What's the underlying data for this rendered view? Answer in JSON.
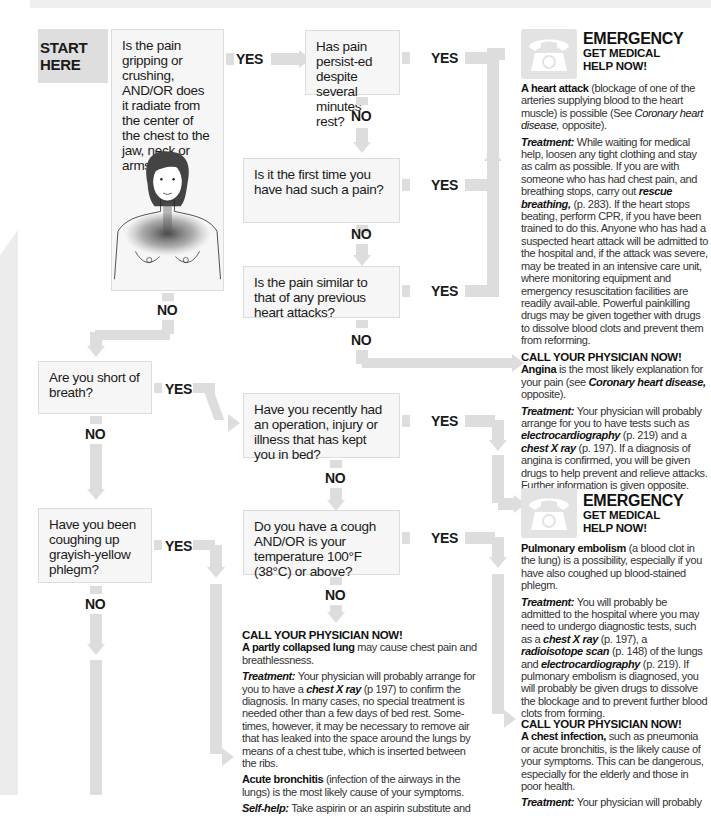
{
  "start": {
    "line1": "START",
    "line2": "HERE"
  },
  "questions": {
    "q1": "Is the pain gripping or crushing, AND/OR does it radiate from the center of the chest to the jaw, neck or arms?",
    "q2": "Has pain persist-ed despite several minutes' rest?",
    "q3": "Is it the first time you have had such a pain?",
    "q4": "Is the pain similar to that of any previous heart attacks?",
    "q5": "Are you short of breath?",
    "q6": "Have you recently had an operation, injury or illness that has kept you in bed?",
    "q7": "Have you been coughing up grayish-yellow phlegm?",
    "q8": "Do you have a cough AND/OR is your temperature 100°F (38°C) or above?"
  },
  "labels": {
    "yes": "YES",
    "no": "NO"
  },
  "emergency": {
    "title": "EMERGENCY",
    "subtitle1": "GET MEDICAL",
    "subtitle2": "HELP NOW!",
    "icon": "telephone-icon"
  },
  "call_physician": "CALL YOUR PHYSICIAN NOW!",
  "treatment_label": "Treatment:",
  "selfhelp_label": "Self-help:",
  "outcomes": {
    "heart_attack": {
      "bold": "A heart attack",
      "text1": " (blockage of one of the arteries supplying blood to the heart muscle) is possible (See ",
      "ref": "Coronary heart disease,",
      "text2": " opposite).",
      "t1": " While waiting for medical help, loosen any tight clothing and stay as calm as possible. If you are with someone who has had chest pain, and breathing stops, carry out ",
      "t_ref": "rescue breathing,",
      "t2": " (p. 283). If the heart stops beating, perform CPR, if you have been trained to do this. Anyone who has had a suspected heart attack will be admitted to the hospital and, if the attack was severe, may be treated in an intensive care unit, where monitoring equipment and emergency resuscitation facilities are readily avail-able. Powerful painkilling drugs may be given together with drugs to dissolve blood clots and prevent them from reforming."
    },
    "angina": {
      "bold": "Angina",
      "text1": " is the most likely explanation for your pain (see ",
      "ref": "Coronary heart disease,",
      "text2": " opposite).",
      "t1": " Your physician will probably arrange for you to have tests such as ",
      "t_ref1": "electrocardiography",
      "t2": " (p. 219) and a ",
      "t_ref2": "chest X ray",
      "t3": " (p. 197). If a diagnosis of angina is confirmed, you will be given drugs to help prevent and relieve attacks. Further information is given opposite."
    },
    "pulmonary_embolism": {
      "bold": "Pulmonary embolism",
      "text1": " (a blood clot in the lung) is a possibility, especially if you have also coughed up blood-stained phlegm.",
      "t1": " You will probably be admitted to the hospital where you may need to undergo diagnostic tests, such as a ",
      "t_ref1": "chest X ray",
      "t2": " (p. 197), a ",
      "t_ref2": "radioisotope scan",
      "t3": " (p. 148) of the lungs and ",
      "t_ref3": "electrocardiography",
      "t4": " (p. 219). If pulmonary embolism is diagnosed, you will probably be given drugs to dissolve the blockage and to prevent further blood clots from forming."
    },
    "collapsed_lung": {
      "bold": "A partly collapsed lung",
      "text1": " may cause chest pain and breathlessness.",
      "t1": " Your physician will probably arrange for you to have a ",
      "t_ref1": "chest X ray",
      "t2": " (p 197) to confirm the diagnosis. In many cases, no special treatment is needed other than a few days of bed rest. Some-times, however, it may be necessary to remove air that has leaked into the space around the lungs by means of a chest tube, which is inserted between the ribs."
    },
    "acute_bronchitis": {
      "bold": "Acute bronchitis",
      "text1": " (infection of the airways in the lungs) is the most likely cause of your symptoms.",
      "s1": " Take aspirin or an aspirin substitute and"
    },
    "chest_infection": {
      "bold": "A chest infection,",
      "text1": " such as pneumonia or acute bronchitis, is the likely cause of your symptoms. This can be dangerous, especially for the elderly and those in poor health.",
      "t1": " Your physician will probably"
    }
  }
}
